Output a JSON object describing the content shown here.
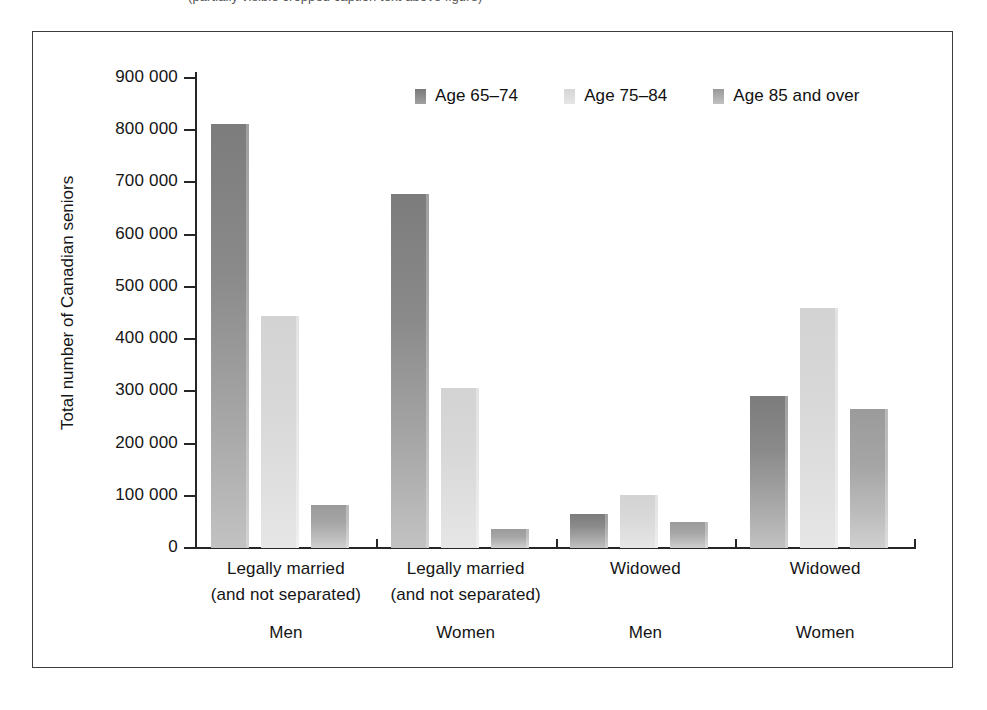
{
  "caption": {
    "cropped_text": "(partially visible cropped caption text above figure)"
  },
  "figure": {
    "y_axis_title": "Total number of Canadian seniors"
  },
  "chart_data": {
    "type": "bar",
    "title": "",
    "xlabel": "",
    "ylabel": "Total number of Canadian seniors",
    "ylim": [
      0,
      900000
    ],
    "ytick_labels": [
      "900 000",
      "800 000",
      "700 000",
      "600 000",
      "500 000",
      "400 000",
      "300 000",
      "200 000",
      "100 000",
      "0"
    ],
    "ytick_values": [
      900000,
      800000,
      700000,
      600000,
      500000,
      400000,
      300000,
      200000,
      100000,
      0
    ],
    "grid": false,
    "legend_position": "top-center",
    "categories": [
      "Legally married (and not separated) Men",
      "Legally married (and not separated) Women",
      "Widowed Men",
      "Widowed Women"
    ],
    "category_lines": [
      {
        "line1": "Legally married",
        "line2": "(and not separated)",
        "line3": "Men"
      },
      {
        "line1": "Legally married",
        "line2": "(and not separated)",
        "line3": "Women"
      },
      {
        "line1": "Widowed",
        "line2": "",
        "line3": "Men"
      },
      {
        "line1": "Widowed",
        "line2": "",
        "line3": "Women"
      }
    ],
    "series": [
      {
        "name": "Age 65–74",
        "color": "#8a8a8a",
        "values": [
          812000,
          677000,
          66000,
          292000
        ]
      },
      {
        "name": "Age 75–84",
        "color": "#dcdcdc",
        "values": [
          445000,
          307000,
          102000,
          459000
        ]
      },
      {
        "name": "Age 85 and over",
        "color": "#a9a9a9",
        "values": [
          82000,
          37000,
          50000,
          267000
        ]
      }
    ]
  },
  "legend": {
    "items": [
      {
        "label": "Age 65–74"
      },
      {
        "label": "Age 75–84"
      },
      {
        "label": "Age 85 and over"
      }
    ]
  }
}
